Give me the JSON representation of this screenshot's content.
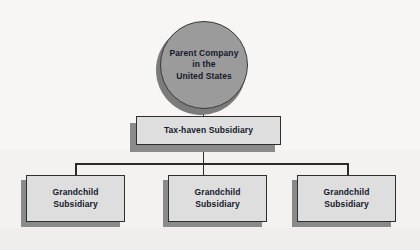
{
  "diagram": {
    "type": "hierarchy-org-chart",
    "colors": {
      "background": "#f6f5f3",
      "circle_fill": "#9b9b9b",
      "circle_shadow": "#7b7b7b",
      "box_fill": "#dedede",
      "box_shadow": "#8a8a8a",
      "border": "#2f2f2f",
      "text": "#15192b"
    },
    "root": {
      "shape": "circle",
      "lines": [
        "Parent Company",
        "in the",
        "United States"
      ]
    },
    "middle": {
      "shape": "rectangle",
      "lines": [
        "Tax-haven Subsidiary"
      ]
    },
    "children": [
      {
        "shape": "rectangle",
        "lines": [
          "Grandchild",
          "Subsidiary"
        ]
      },
      {
        "shape": "rectangle",
        "lines": [
          "Grandchild",
          "Subsidiary"
        ]
      },
      {
        "shape": "rectangle",
        "lines": [
          "Grandchild",
          "Subsidiary"
        ]
      }
    ]
  }
}
